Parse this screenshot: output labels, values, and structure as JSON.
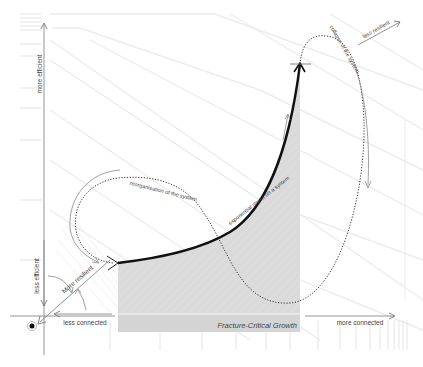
{
  "diagram": {
    "axes": {
      "y_top_label": "more efficient",
      "y_bottom_label": "less efficient",
      "x_left_label": "less connected",
      "x_right_label": "more connected",
      "diagonal_label": "More resilient",
      "diagonal_top_label": "less resilient"
    },
    "region": {
      "label": "Fracture-Critical Growth",
      "fill": "#d9d9d9"
    },
    "curves": {
      "growth_label": "exponential stress on a system",
      "collapse_label": "collapse of the system",
      "reorganisation_label": "reorganisation of the system"
    },
    "colors": {
      "axis": "#777777",
      "curve": "#111111",
      "guide": "#e6e6e6",
      "text": "#444444"
    }
  }
}
